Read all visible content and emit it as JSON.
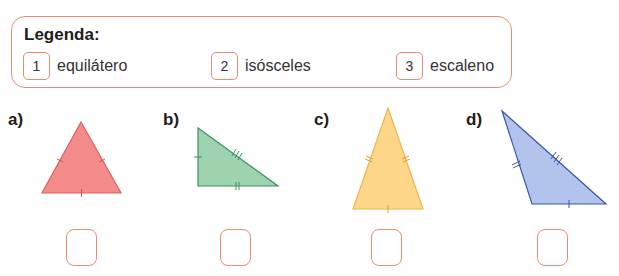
{
  "legend": {
    "title": "Legenda:",
    "items": [
      {
        "number": "1",
        "label": "equilátero"
      },
      {
        "number": "2",
        "label": "isósceles"
      },
      {
        "number": "3",
        "label": "escaleno"
      }
    ]
  },
  "triangles": [
    {
      "label": "a)",
      "type_shown": "equilateral",
      "fill": "#f38b8b",
      "stroke": "#e06060",
      "answer": ""
    },
    {
      "label": "b)",
      "type_shown": "right scalene",
      "fill": "#9ed3b0",
      "stroke": "#3f8f62",
      "answer": ""
    },
    {
      "label": "c)",
      "type_shown": "isosceles",
      "fill": "#fdd68a",
      "stroke": "#f0b450",
      "answer": ""
    },
    {
      "label": "d)",
      "type_shown": "obtuse scalene",
      "fill": "#b2c3ec",
      "stroke": "#3c57a8",
      "answer": ""
    }
  ],
  "colors": {
    "accent_border": "#ee8a72",
    "text": "#1d1d1b"
  }
}
